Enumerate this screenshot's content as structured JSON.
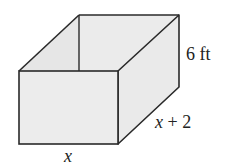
{
  "figure": {
    "type": "open-top rectangular box",
    "labels": {
      "height": "6 ft",
      "depth": "x + 2",
      "width": "x"
    },
    "colors": {
      "edge": "#2a2a2a",
      "face_fill": "#ebebeb",
      "inner_wall_fill": "#e6e6e6",
      "background": "#ffffff"
    }
  }
}
